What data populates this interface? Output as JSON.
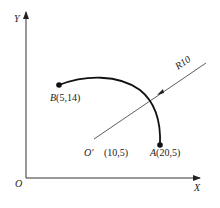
{
  "diagram": {
    "axes": {
      "x_label": "X",
      "y_label": "Y",
      "origin_label": "O"
    },
    "points": {
      "B": {
        "letter": "B",
        "coords": "(5,14)"
      },
      "A": {
        "letter": "A",
        "coords": "(20,5)"
      },
      "center": {
        "letter": "O'",
        "coords": "(10,5)"
      }
    },
    "radius_label": "R10",
    "colors": {
      "stroke": "#333333",
      "arc": "#111111",
      "text": "#222222",
      "background": "#ffffff"
    }
  }
}
